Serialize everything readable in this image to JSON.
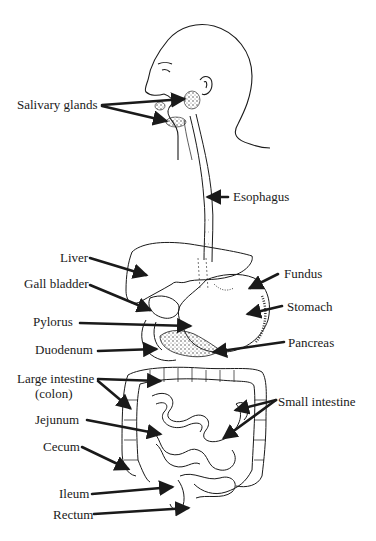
{
  "diagram": {
    "type": "labeled anatomical diagram",
    "labels": [
      {
        "id": "salivary_glands",
        "text": "Salivary glands",
        "x": 17,
        "y": 98
      },
      {
        "id": "esophagus",
        "text": "Esophagus",
        "x": 233,
        "y": 190
      },
      {
        "id": "liver",
        "text": "Liver",
        "x": 60,
        "y": 251
      },
      {
        "id": "gall_bladder",
        "text": "Gall bladder",
        "x": 24,
        "y": 277
      },
      {
        "id": "fundus",
        "text": "Fundus",
        "x": 284,
        "y": 267
      },
      {
        "id": "stomach",
        "text": "Stomach",
        "x": 287,
        "y": 300
      },
      {
        "id": "pylorus",
        "text": "Pylorus",
        "x": 33,
        "y": 315
      },
      {
        "id": "pancreas",
        "text": "Pancreas",
        "x": 288,
        "y": 336
      },
      {
        "id": "duodenum",
        "text": "Duodenum",
        "x": 35,
        "y": 343
      },
      {
        "id": "large_intestine",
        "text": "Large intestine",
        "x": 17,
        "y": 372
      },
      {
        "id": "colon",
        "text": "(colon)",
        "x": 35,
        "y": 387
      },
      {
        "id": "small_intestine",
        "text": "Small intestine",
        "x": 278,
        "y": 395
      },
      {
        "id": "jejunum",
        "text": "Jejunum",
        "x": 35,
        "y": 413
      },
      {
        "id": "cecum",
        "text": "Cecum",
        "x": 43,
        "y": 440
      },
      {
        "id": "ileum",
        "text": "Ileum",
        "x": 59,
        "y": 487
      },
      {
        "id": "rectum",
        "text": "Rectum",
        "x": 53,
        "y": 508
      }
    ]
  },
  "colors": {
    "ink": "#1a1a1a",
    "background": "#ffffff"
  }
}
